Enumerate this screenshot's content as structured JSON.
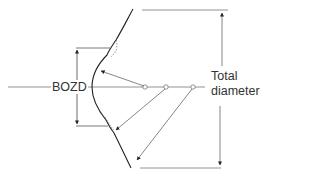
{
  "diagram": {
    "title": "",
    "labels": {
      "bozd": "BOZD",
      "total_line1": "Total",
      "total_line2": "diameter"
    },
    "colors": {
      "line": "#555555",
      "curve": "#222222",
      "text": "#333333"
    },
    "elements": {
      "axis": "horizontal optical axis through centres of curvature",
      "lens_profile": "contact lens back surface profile",
      "centres_of_curvature": 3,
      "radius_arrows": 3,
      "dimension_bozd": "vertical dimension arrow for back optic zone diameter",
      "dimension_total": "vertical dimension arrow for total diameter"
    }
  }
}
